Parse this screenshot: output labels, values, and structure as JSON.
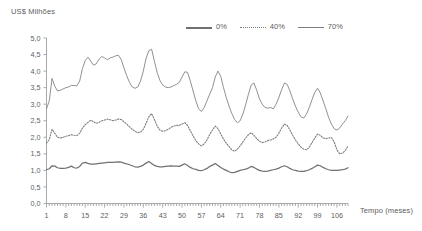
{
  "chart_data": {
    "type": "line",
    "title": "",
    "ylabel": "US$ Milhões",
    "xlabel": "Tempo (meses)",
    "ylim": [
      0.0,
      5.0
    ],
    "xlim": [
      1,
      110
    ],
    "grid": false,
    "legend_position": "top-center",
    "y_ticks": [
      "0,0",
      "0,5",
      "1,0",
      "1,5",
      "2,0",
      "2,5",
      "3,0",
      "3,5",
      "4,0",
      "4,5",
      "5,0"
    ],
    "y_tick_values": [
      0.0,
      0.5,
      1.0,
      1.5,
      2.0,
      2.5,
      3.0,
      3.5,
      4.0,
      4.5,
      5.0
    ],
    "x_ticks": [
      "1",
      "8",
      "15",
      "22",
      "29",
      "36",
      "43",
      "50",
      "57",
      "64",
      "71",
      "78",
      "85",
      "92",
      "99",
      "106"
    ],
    "x_tick_values": [
      1,
      8,
      15,
      22,
      29,
      36,
      43,
      50,
      57,
      64,
      71,
      78,
      85,
      92,
      99,
      106
    ],
    "x_minor_tick_step": 1,
    "series": [
      {
        "name": "0%",
        "style": "solid-thick",
        "color": "#6f7173",
        "values": [
          1.02,
          1.05,
          1.14,
          1.13,
          1.08,
          1.06,
          1.06,
          1.07,
          1.09,
          1.13,
          1.08,
          1.07,
          1.12,
          1.22,
          1.24,
          1.21,
          1.19,
          1.19,
          1.2,
          1.21,
          1.22,
          1.23,
          1.24,
          1.24,
          1.24,
          1.25,
          1.26,
          1.25,
          1.22,
          1.2,
          1.17,
          1.14,
          1.11,
          1.1,
          1.12,
          1.16,
          1.22,
          1.27,
          1.21,
          1.15,
          1.12,
          1.11,
          1.11,
          1.12,
          1.13,
          1.14,
          1.13,
          1.13,
          1.12,
          1.16,
          1.2,
          1.15,
          1.09,
          1.05,
          1.03,
          1.0,
          0.99,
          1.02,
          1.06,
          1.12,
          1.16,
          1.21,
          1.15,
          1.09,
          1.04,
          1.0,
          0.96,
          0.93,
          0.94,
          0.97,
          1.0,
          1.02,
          1.04,
          1.07,
          1.12,
          1.09,
          1.04,
          1.0,
          0.98,
          0.97,
          0.98,
          1.0,
          1.02,
          1.04,
          1.07,
          1.11,
          1.14,
          1.11,
          1.06,
          1.02,
          1.0,
          0.98,
          0.97,
          0.97,
          0.99,
          1.02,
          1.06,
          1.11,
          1.16,
          1.14,
          1.09,
          1.05,
          1.02,
          1.0,
          1.0,
          1.0,
          1.01,
          1.02,
          1.04,
          1.08
        ]
      },
      {
        "name": "40%",
        "style": "dotted",
        "color": "#7b7d7f",
        "values": [
          1.82,
          1.93,
          2.24,
          2.12,
          2.0,
          1.98,
          2.0,
          2.03,
          2.05,
          2.08,
          2.06,
          2.05,
          2.12,
          2.28,
          2.38,
          2.45,
          2.52,
          2.47,
          2.42,
          2.45,
          2.5,
          2.52,
          2.55,
          2.53,
          2.5,
          2.52,
          2.55,
          2.54,
          2.47,
          2.4,
          2.32,
          2.24,
          2.18,
          2.14,
          2.16,
          2.24,
          2.42,
          2.62,
          2.72,
          2.54,
          2.34,
          2.22,
          2.18,
          2.2,
          2.24,
          2.3,
          2.34,
          2.36,
          2.36,
          2.4,
          2.44,
          2.36,
          2.2,
          2.04,
          1.9,
          1.8,
          1.74,
          1.8,
          1.92,
          2.08,
          2.22,
          2.34,
          2.26,
          2.1,
          1.94,
          1.82,
          1.72,
          1.62,
          1.58,
          1.64,
          1.74,
          1.86,
          1.98,
          2.08,
          2.14,
          2.06,
          1.96,
          1.88,
          1.84,
          1.86,
          1.9,
          1.92,
          1.95,
          2.0,
          2.12,
          2.28,
          2.4,
          2.36,
          2.22,
          2.06,
          1.92,
          1.8,
          1.7,
          1.64,
          1.62,
          1.7,
          1.84,
          1.98,
          2.1,
          2.06,
          1.98,
          1.96,
          1.98,
          1.99,
          1.86,
          1.62,
          1.5,
          1.52,
          1.6,
          1.74
        ]
      },
      {
        "name": "70%",
        "style": "solid-thin",
        "color": "#7b7d7f",
        "values": [
          2.86,
          3.1,
          3.78,
          3.54,
          3.4,
          3.42,
          3.46,
          3.5,
          3.52,
          3.57,
          3.56,
          3.56,
          3.7,
          4.08,
          4.32,
          4.42,
          4.3,
          4.18,
          4.22,
          4.36,
          4.44,
          4.4,
          4.34,
          4.4,
          4.42,
          4.46,
          4.48,
          4.35,
          4.1,
          3.86,
          3.66,
          3.52,
          3.48,
          3.52,
          3.7,
          4.0,
          4.38,
          4.62,
          4.66,
          4.3,
          3.96,
          3.72,
          3.58,
          3.52,
          3.5,
          3.52,
          3.56,
          3.6,
          3.66,
          3.82,
          3.98,
          3.96,
          3.7,
          3.4,
          3.1,
          2.86,
          2.78,
          2.9,
          3.1,
          3.3,
          3.5,
          3.82,
          4.0,
          3.84,
          3.5,
          3.2,
          2.94,
          2.72,
          2.54,
          2.44,
          2.5,
          2.7,
          2.98,
          3.3,
          3.58,
          3.64,
          3.42,
          3.16,
          3.0,
          2.9,
          2.88,
          2.9,
          2.86,
          3.0,
          3.2,
          3.44,
          3.64,
          3.6,
          3.4,
          3.16,
          2.94,
          2.76,
          2.62,
          2.58,
          2.7,
          2.9,
          3.14,
          3.36,
          3.48,
          3.34,
          3.1,
          2.86,
          2.6,
          2.4,
          2.26,
          2.22,
          2.28,
          2.4,
          2.5,
          2.64
        ]
      }
    ]
  },
  "legend": {
    "items": [
      {
        "label": "0%"
      },
      {
        "label": "40%"
      },
      {
        "label": "70%"
      }
    ]
  },
  "axes": {
    "y_title": "US$ Milhões",
    "x_title": "Tempo (meses)"
  }
}
